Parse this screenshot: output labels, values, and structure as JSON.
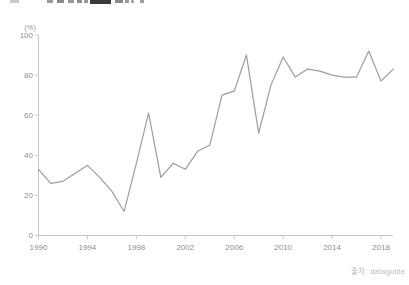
{
  "footer": {
    "source": "출처: dataguide"
  },
  "chart_data": {
    "type": "line",
    "unit_label": "(%)",
    "x": [
      1990,
      1991,
      1992,
      1993,
      1994,
      1995,
      1996,
      1997,
      1998,
      1999,
      2000,
      2001,
      2002,
      2003,
      2004,
      2005,
      2006,
      2007,
      2008,
      2009,
      2010,
      2011,
      2012,
      2013,
      2014,
      2015,
      2016,
      2017,
      2018,
      2019
    ],
    "values": [
      33,
      26,
      27,
      31,
      35,
      29,
      22,
      12,
      36,
      61,
      29,
      36,
      33,
      42,
      45,
      70,
      72,
      90,
      51,
      75,
      89,
      79,
      83,
      82,
      80,
      79,
      79,
      92,
      77,
      83
    ],
    "x_ticks": [
      1990,
      1994,
      1998,
      2002,
      2006,
      2010,
      2014,
      2018
    ],
    "y_ticks": [
      0,
      20,
      40,
      60,
      80,
      100
    ],
    "xlim": [
      1990,
      2019
    ],
    "ylim": [
      0,
      100
    ],
    "grid": false,
    "legend": "none",
    "line_color": "#9d9d9d",
    "axis_color": "#c6c6c6",
    "tick_label_color": "#8f8f8f"
  }
}
